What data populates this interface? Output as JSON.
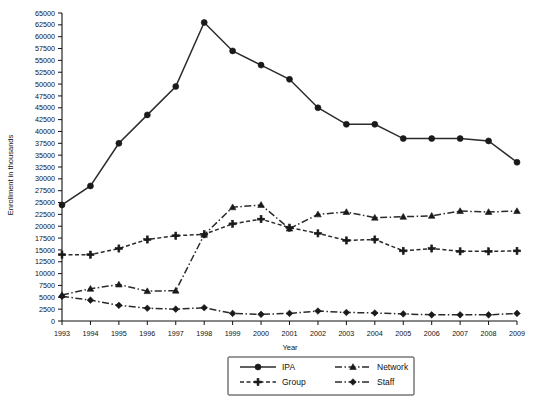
{
  "chart_data": {
    "type": "line",
    "title": "",
    "xlabel": "Year",
    "ylabel": "Enrollment in thousands",
    "x": [
      1993,
      1994,
      1995,
      1996,
      1997,
      1998,
      1999,
      2000,
      2001,
      2002,
      2003,
      2004,
      2005,
      2006,
      2007,
      2008,
      2009
    ],
    "categories": [
      "1993",
      "1994",
      "1995",
      "1996",
      "1997",
      "1998",
      "1999",
      "2000",
      "2001",
      "2002",
      "2003",
      "2004",
      "2005",
      "2006",
      "2007",
      "2008",
      "2009"
    ],
    "ylim": [
      0,
      65000
    ],
    "ytick_step": 2500,
    "yticks": [
      0,
      2500,
      5000,
      7500,
      10000,
      12500,
      15000,
      17500,
      20000,
      22500,
      25000,
      27500,
      30000,
      32500,
      35000,
      37500,
      40000,
      42500,
      45000,
      47500,
      50000,
      52500,
      55000,
      57500,
      60000,
      62500,
      65000
    ],
    "ytick_labels": [
      "0",
      "2500",
      "5000",
      "7500",
      "10000",
      "12500",
      "15000",
      "17500",
      "20000",
      "22500",
      "25000",
      "27500",
      "30000",
      "32500",
      "35000",
      "37500",
      "40000",
      "42500",
      "45000",
      "47500",
      "50000",
      "52500",
      "55000",
      "57500",
      "60000",
      "62500",
      "65000"
    ],
    "grid": false,
    "legend_position": "bottom-center",
    "series": [
      {
        "name": "IPA",
        "marker": "circle",
        "dash": "solid",
        "values": [
          24500,
          28500,
          37500,
          43500,
          49500,
          63000,
          57000,
          54000,
          51000,
          45000,
          41500,
          41500,
          38500,
          38500,
          38500,
          38000,
          33500
        ]
      },
      {
        "name": "Network",
        "marker": "triangle",
        "dash": "dashdot",
        "values": [
          5500,
          6800,
          7700,
          6300,
          6400,
          18200,
          24000,
          24500,
          19500,
          22500,
          23000,
          21800,
          22000,
          22200,
          23200,
          23000,
          23200
        ]
      },
      {
        "name": "Group",
        "marker": "plus",
        "dash": "dashed",
        "values": [
          14000,
          14000,
          15300,
          17200,
          18000,
          18300,
          20500,
          21500,
          19700,
          18500,
          17000,
          17200,
          14800,
          15300,
          14700,
          14700,
          14800
        ]
      },
      {
        "name": "Staff",
        "marker": "diamond",
        "dash": "dashdot",
        "values": [
          5200,
          4400,
          3300,
          2700,
          2500,
          2800,
          1600,
          1400,
          1600,
          2100,
          1800,
          1700,
          1500,
          1300,
          1300,
          1300,
          1600
        ]
      }
    ]
  },
  "legend": {
    "items": [
      {
        "label": "IPA"
      },
      {
        "label": "Network"
      },
      {
        "label": "Group"
      },
      {
        "label": "Staff"
      }
    ]
  }
}
